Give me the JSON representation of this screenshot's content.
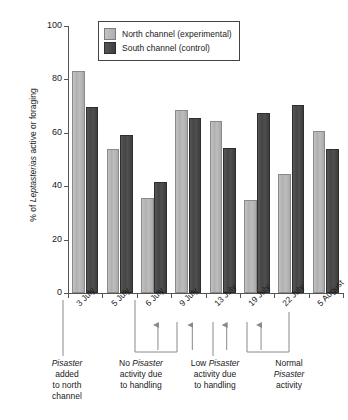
{
  "chart_data": {
    "type": "bar",
    "title": "",
    "xlabel": "",
    "ylabel": "% of Leptasterias active or foraging",
    "ylabel_parts": {
      "prefix": "% of ",
      "italic": "Leptasterias",
      "suffix": " active or foraging"
    },
    "categories": [
      "3 July",
      "5 July",
      "6 July",
      "9 July",
      "13 July",
      "19 July",
      "22 July",
      "5 August"
    ],
    "series": [
      {
        "name": "North channel (experimental)",
        "color": "#b8b8b8",
        "values": [
          83,
          54,
          35.5,
          68.5,
          64.5,
          35,
          44.5,
          60.5
        ]
      },
      {
        "name": "South channel (control)",
        "color": "#474747",
        "values": [
          69.5,
          59,
          41.5,
          65.5,
          54.5,
          67.5,
          70.5,
          54
        ]
      }
    ],
    "ylim": [
      0,
      100
    ],
    "yticks": [
      0,
      20,
      40,
      60,
      80,
      100
    ],
    "grid": false,
    "legend_position": "top-center"
  },
  "legend": {
    "items": [
      {
        "label": "North channel (experimental)",
        "swatch": "light-gray"
      },
      {
        "label": "South channel (control)",
        "swatch": "dark-gray"
      }
    ]
  },
  "arrows": {
    "at_categories": [
      "6 July",
      "9 July",
      "13 July",
      "19 July"
    ]
  },
  "annotations": [
    {
      "id": "pisaster-added",
      "lines": [
        {
          "italic": "Pisaster",
          "plain": ""
        },
        {
          "italic": "",
          "plain": "added"
        },
        {
          "italic": "",
          "plain": "to north"
        },
        {
          "italic": "",
          "plain": "channel"
        }
      ],
      "text": "Pisaster added to north channel"
    },
    {
      "id": "no-pisaster-activity",
      "lines": [
        {
          "italic": "Pisaster",
          "plain": "No "
        },
        {
          "italic": "",
          "plain": "activity due"
        },
        {
          "italic": "",
          "plain": "to handling"
        }
      ],
      "text": "No Pisaster activity due to handling"
    },
    {
      "id": "low-pisaster-activity",
      "lines": [
        {
          "italic": "Pisaster",
          "plain": "Low "
        },
        {
          "italic": "",
          "plain": "activity due"
        },
        {
          "italic": "",
          "plain": "to handling"
        }
      ],
      "text": "Low Pisaster activity due to handling"
    },
    {
      "id": "normal-pisaster-activity",
      "lines": [
        {
          "italic": "",
          "plain": "Normal"
        },
        {
          "italic": "Pisaster",
          "plain": ""
        },
        {
          "italic": "",
          "plain": "activity"
        }
      ],
      "text": "Normal Pisaster activity"
    }
  ]
}
